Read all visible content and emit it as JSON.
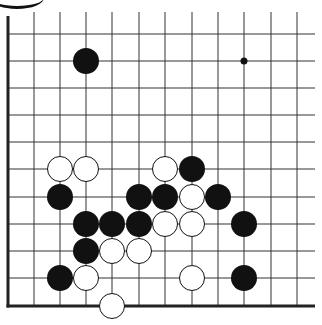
{
  "board": {
    "type": "go-diagram-fragment",
    "colors": {
      "background": "#ffffff",
      "line": "#333333",
      "edge": "#222222",
      "black_stone": "#111111",
      "white_stone": "#ffffff",
      "white_outline": "#111111"
    },
    "column_x": [
      8,
      34,
      60,
      86,
      112,
      139,
      165,
      192,
      218,
      244,
      271,
      297
    ],
    "row_y": [
      8,
      34,
      61,
      88,
      115,
      142,
      169,
      197,
      224,
      251,
      278,
      306
    ],
    "left_edge": {
      "x": 8,
      "y1": 16,
      "y2": 306
    },
    "bottom_edge": {
      "y": 306,
      "x1": 8,
      "x2": 315
    },
    "line_extent": {
      "x_max": 315,
      "y_min": 12
    },
    "star_points": [
      {
        "col": 9,
        "row": 2
      }
    ],
    "stones": [
      {
        "color": "black",
        "col": 3,
        "row": 2
      },
      {
        "color": "white",
        "col": 2,
        "row": 6
      },
      {
        "color": "white",
        "col": 3,
        "row": 6
      },
      {
        "color": "white",
        "col": 6,
        "row": 6
      },
      {
        "color": "black",
        "col": 7,
        "row": 6
      },
      {
        "color": "black",
        "col": 2,
        "row": 7
      },
      {
        "color": "black",
        "col": 5,
        "row": 7
      },
      {
        "color": "black",
        "col": 6,
        "row": 7
      },
      {
        "color": "white",
        "col": 7,
        "row": 7
      },
      {
        "color": "black",
        "col": 8,
        "row": 7
      },
      {
        "color": "black",
        "col": 3,
        "row": 8
      },
      {
        "color": "black",
        "col": 4,
        "row": 8
      },
      {
        "color": "black",
        "col": 5,
        "row": 8
      },
      {
        "color": "white",
        "col": 6,
        "row": 8
      },
      {
        "color": "white",
        "col": 7,
        "row": 8
      },
      {
        "color": "black",
        "col": 9,
        "row": 8
      },
      {
        "color": "black",
        "col": 3,
        "row": 9
      },
      {
        "color": "white",
        "col": 4,
        "row": 9
      },
      {
        "color": "white",
        "col": 5,
        "row": 9
      },
      {
        "color": "black",
        "col": 2,
        "row": 10
      },
      {
        "color": "white",
        "col": 3,
        "row": 10
      },
      {
        "color": "white",
        "col": 7,
        "row": 10
      },
      {
        "color": "black",
        "col": 9,
        "row": 10
      },
      {
        "color": "white",
        "col": 4,
        "row": 11
      }
    ],
    "stone_radius": 13
  }
}
